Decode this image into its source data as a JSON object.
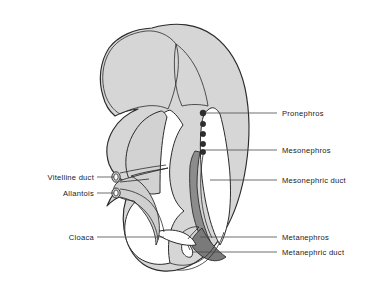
{
  "figure": {
    "title": "Developing nephric system of a vertebrate embryo (lateral view)",
    "background_color": "#ffffff",
    "width": 388,
    "height": 285
  },
  "colors": {
    "body_fill": "#d6d6d6",
    "outline": "#2b2b2b",
    "duct_dark": "#8c8c8c",
    "nephric_dot": "#2e2e2e",
    "cavity_white": "#ffffff",
    "leader_line": "#4a4a4a",
    "label_text": "#1a1a1a"
  },
  "labels_right": [
    {
      "id": "pronephros",
      "text": "Pronephros",
      "x": 282,
      "y": 116,
      "leader_from_x": 205,
      "leader_from_y": 113,
      "leader_to_x": 277,
      "leader_to_y": 113
    },
    {
      "id": "mesonephros",
      "text": "Mesonephros",
      "x": 282,
      "y": 153,
      "leader_from_x": 205,
      "leader_from_y": 150,
      "leader_to_x": 277,
      "leader_to_y": 150
    },
    {
      "id": "mesonephric-duct",
      "text": "Mesonephric duct",
      "x": 282,
      "y": 183,
      "leader_from_x": 210,
      "leader_from_y": 180,
      "leader_to_x": 277,
      "leader_to_y": 180
    },
    {
      "id": "metanephros",
      "text": "Metanephros",
      "x": 282,
      "y": 240,
      "leader_from_x": 200,
      "leader_from_y": 237,
      "leader_to_x": 277,
      "leader_to_y": 237
    },
    {
      "id": "metanephric-duct",
      "text": "Metanephric duct",
      "x": 282,
      "y": 255,
      "leader_from_x": 192,
      "leader_from_y": 252,
      "leader_to_x": 277,
      "leader_to_y": 252
    }
  ],
  "labels_left": [
    {
      "id": "vitelline-duct",
      "text": "Vitelline duct",
      "x": 94,
      "y": 180,
      "leader_from_x": 97,
      "leader_from_y": 177,
      "leader_to_x": 114,
      "leader_to_y": 177
    },
    {
      "id": "allantois",
      "text": "Allantois",
      "x": 94,
      "y": 196,
      "leader_from_x": 97,
      "leader_from_y": 193,
      "leader_to_x": 114,
      "leader_to_y": 193
    },
    {
      "id": "cloaca",
      "text": "Cloaca",
      "x": 94,
      "y": 240,
      "leader_from_x": 97,
      "leader_from_y": 237,
      "leader_to_x": 164,
      "leader_to_y": 237
    }
  ],
  "nephric_dots": [
    {
      "id": "dot-1",
      "cx": 203,
      "cy": 113,
      "r": 3.0
    },
    {
      "id": "dot-2",
      "cx": 203,
      "cy": 124,
      "r": 2.7
    },
    {
      "id": "dot-3",
      "cx": 203,
      "cy": 134,
      "r": 2.7
    },
    {
      "id": "dot-4",
      "cx": 203,
      "cy": 144,
      "r": 2.7
    },
    {
      "id": "dot-5",
      "cx": 203,
      "cy": 152,
      "r": 2.7
    }
  ],
  "structures": [
    {
      "id": "embryo-body",
      "name": "embryo-body-outline"
    },
    {
      "id": "head-brain",
      "name": "head-region"
    },
    {
      "id": "heart-liver-bulge",
      "name": "heart-liver-bulge"
    },
    {
      "id": "gut-cavity",
      "name": "gut-cavity"
    },
    {
      "id": "neural-tube",
      "name": "neural-tube-channel"
    },
    {
      "id": "mesonephric-duct",
      "name": "mesonephric-duct-band"
    },
    {
      "id": "metanephric-duct",
      "name": "metanephric-duct-band"
    },
    {
      "id": "vitelline-allantois-tube",
      "name": "vitelline-allantois-tube"
    },
    {
      "id": "cloaca-chamber",
      "name": "cloaca-chamber"
    },
    {
      "id": "tail",
      "name": "tail-region"
    }
  ]
}
